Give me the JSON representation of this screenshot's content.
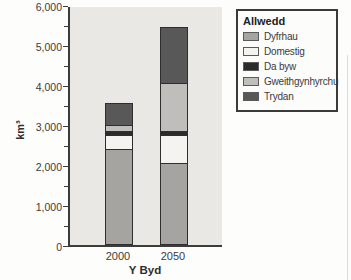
{
  "figure": {
    "ylabel": "km³",
    "xlabel": "Y Byd",
    "legend_title": "Allwedd"
  },
  "chart_data": {
    "type": "bar",
    "stacked": true,
    "title": "",
    "xlabel": "Y Byd",
    "ylabel": "km³",
    "categories": [
      "2000",
      "2050"
    ],
    "series": [
      {
        "name": "Dyfrhau",
        "values": [
          2400,
          2050
        ],
        "color": "#a5a4a1"
      },
      {
        "name": "Domestig",
        "values": [
          350,
          700
        ],
        "color": "#f4f3f0"
      },
      {
        "name": "Da byw",
        "values": [
          100,
          100
        ],
        "color": "#2b2b2b"
      },
      {
        "name": "Gweithgynhyrchu",
        "values": [
          150,
          1200
        ],
        "color": "#bfbebb"
      },
      {
        "name": "Trydan",
        "values": [
          550,
          1400
        ],
        "color": "#585858"
      }
    ],
    "totals": [
      3550,
      5450
    ],
    "ylim": [
      0,
      6000
    ],
    "ytick_step": 1000,
    "minor_tick_step": 500,
    "ytick_labels": [
      "0",
      "1,000",
      "2,000",
      "3,000",
      "4,000",
      "5,000",
      "6,000"
    ],
    "legend_title": "Allwedd",
    "legend_position": "outside-top-right",
    "grid": false,
    "plot_background": "#e9e8e5",
    "axis_color": "#3c3c3c"
  }
}
